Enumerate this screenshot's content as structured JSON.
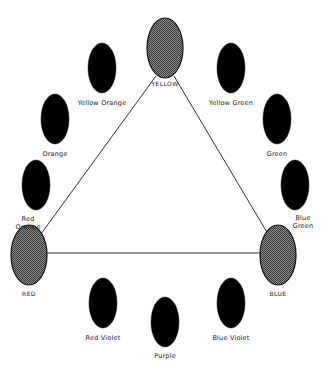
{
  "diagram": {
    "type": "color-wheel",
    "colors": {
      "primary_fill": "#6a6a6a",
      "secondary_fill": "#000000",
      "line": "#333333"
    },
    "primaries": [
      {
        "id": "yellow",
        "label": "YELLOW",
        "cx": 165,
        "cy": 48,
        "label_x": 165,
        "label_y": 80
      },
      {
        "id": "red",
        "label": "RED",
        "cx": 29,
        "cy": 255,
        "label_x": 29,
        "label_y": 290
      },
      {
        "id": "blue",
        "label": "BLUE",
        "cx": 278,
        "cy": 255,
        "label_x": 278,
        "label_y": 290
      }
    ],
    "secondaries": [
      {
        "id": "yellow-orange",
        "label": "Yellow Orange",
        "cx": 102,
        "cy": 68,
        "label_x": 102,
        "label_y": 99
      },
      {
        "id": "yellow-green",
        "label": "Yellow Green",
        "cx": 231,
        "cy": 68,
        "label_x": 231,
        "label_y": 99
      },
      {
        "id": "orange",
        "label": "Orange",
        "cx": 55,
        "cy": 119,
        "label_x": 55,
        "label_y": 150
      },
      {
        "id": "green",
        "label": "Green",
        "cx": 277,
        "cy": 119,
        "label_x": 277,
        "label_y": 150
      },
      {
        "id": "red-orange",
        "label": "Red\nOrange",
        "cx": 36,
        "cy": 185,
        "label_x": 28,
        "label_y": 215
      },
      {
        "id": "blue-green",
        "label": "Blue\nGreen",
        "cx": 295,
        "cy": 185,
        "label_x": 303,
        "label_y": 214
      },
      {
        "id": "red-violet",
        "label": "Red Violet",
        "cx": 103,
        "cy": 303,
        "label_x": 103,
        "label_y": 334
      },
      {
        "id": "purple",
        "label": "Purple",
        "cx": 165,
        "cy": 322,
        "label_x": 165,
        "label_y": 352
      },
      {
        "id": "blue-violet",
        "label": "Blue Violet",
        "cx": 231,
        "cy": 303,
        "label_x": 231,
        "label_y": 334
      }
    ],
    "triangle": {
      "points": [
        [
          156,
          76
        ],
        [
          36,
          240
        ],
        [
          274,
          240
        ],
        [
          174,
          76
        ]
      ]
    }
  }
}
